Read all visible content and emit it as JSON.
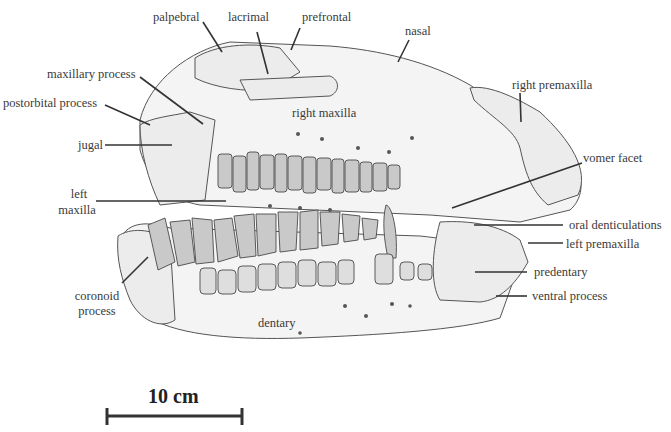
{
  "figure": {
    "scale_bar": {
      "label": "10 cm"
    },
    "labels": [
      {
        "id": "palpebral",
        "text": "palpebral"
      },
      {
        "id": "lacrimal",
        "text": "lacrimal"
      },
      {
        "id": "prefrontal",
        "text": "prefrontal"
      },
      {
        "id": "nasal",
        "text": "nasal"
      },
      {
        "id": "maxillary-process",
        "text": "maxillary process"
      },
      {
        "id": "postorbital-process",
        "text": "postorbital process"
      },
      {
        "id": "jugal",
        "text": "jugal"
      },
      {
        "id": "right-maxilla",
        "text": "right maxilla"
      },
      {
        "id": "right-premaxilla",
        "text": "right premaxilla"
      },
      {
        "id": "vomer-facet",
        "text": "vomer facet"
      },
      {
        "id": "left-maxilla-line1",
        "text": "left"
      },
      {
        "id": "left-maxilla-line2",
        "text": "maxilla"
      },
      {
        "id": "oral-denticulations",
        "text": "oral denticulations"
      },
      {
        "id": "left-premaxilla",
        "text": "left premaxilla"
      },
      {
        "id": "predentary",
        "text": "predentary"
      },
      {
        "id": "ventral-process",
        "text": "ventral process"
      },
      {
        "id": "coronoid-process-line1",
        "text": "coronoid"
      },
      {
        "id": "coronoid-process-line2",
        "text": "process"
      },
      {
        "id": "dentary",
        "text": "dentary"
      }
    ]
  }
}
